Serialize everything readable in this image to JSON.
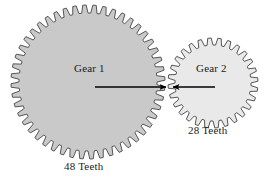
{
  "diagram": {
    "background_color": "#ffffff",
    "outline_color": "#4a4a4a",
    "arrow_color": "#000000",
    "text_color": "#1a1a1a"
  },
  "gears": [
    {
      "id": "gear-1",
      "label": "Gear 1",
      "teeth_label": "48 Teeth",
      "teeth": 48,
      "center_x": 88,
      "center_y": 82,
      "outer_radius": 77,
      "root_radius": 69,
      "fill_color": "#c9c9c9",
      "stroke_color": "#555555"
    },
    {
      "id": "gear-2",
      "label": "Gear 2",
      "teeth_label": "28 Teeth",
      "teeth": 28,
      "center_x": 213,
      "center_y": 83,
      "outer_radius": 45,
      "root_radius": 38,
      "fill_color": "#e9e9e9",
      "stroke_color": "#555555"
    }
  ],
  "arrows": [
    {
      "id": "arrow-gear-1",
      "direction": "right",
      "x1": 95,
      "y1": 87,
      "x2": 166,
      "y2": 87
    },
    {
      "id": "arrow-gear-2",
      "direction": "left",
      "x1": 215,
      "y1": 87,
      "x2": 173,
      "y2": 87
    }
  ]
}
